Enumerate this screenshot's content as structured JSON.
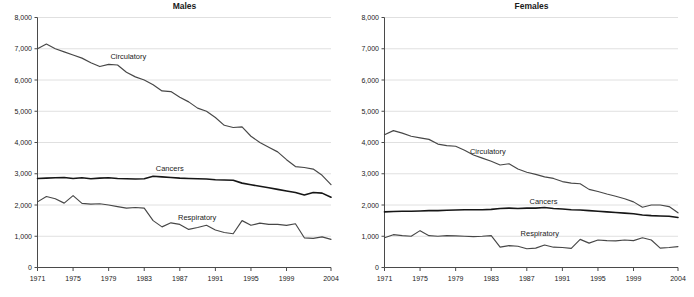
{
  "page": {
    "background": "#ffffff"
  },
  "styles": {
    "line_color": "#474747",
    "bold_line_color": "#161616",
    "grid_color": "#d8d8d8",
    "axis_color": "#4a4a4a",
    "text_color": "#1a1a1a"
  },
  "chart_data": [
    {
      "type": "line",
      "title": "Males",
      "x_start": 1971,
      "x_end": 2004,
      "x_ticks": [
        1971,
        1975,
        1979,
        1983,
        1987,
        1991,
        1995,
        1999,
        2004
      ],
      "y_ticks": [
        0,
        1000,
        2000,
        3000,
        4000,
        5000,
        6000,
        7000,
        8000
      ],
      "y_tick_labels": [
        "0",
        "1,000",
        "2,000",
        "3,000",
        "4,000",
        "5,000",
        "6,000",
        "7,000",
        "8,000"
      ],
      "ylim": [
        0,
        8000
      ],
      "grid": "horizontal",
      "legend": "inline-labels",
      "series": [
        {
          "name": "Circulatory",
          "bold": false,
          "label_anchor": {
            "year": 1979.2,
            "value": 6680
          },
          "values": [
            7000,
            7150,
            7000,
            6900,
            6800,
            6700,
            6550,
            6430,
            6500,
            6480,
            6250,
            6100,
            6000,
            5850,
            5650,
            5630,
            5450,
            5300,
            5100,
            5000,
            4800,
            4550,
            4480,
            4500,
            4200,
            4000,
            3850,
            3700,
            3450,
            3230,
            3200,
            3150,
            2950,
            2650
          ]
        },
        {
          "name": "Cancers",
          "bold": true,
          "label_anchor": {
            "year": 1984.3,
            "value": 3090
          },
          "values": [
            2850,
            2860,
            2870,
            2880,
            2850,
            2870,
            2840,
            2860,
            2870,
            2850,
            2840,
            2830,
            2840,
            2920,
            2900,
            2880,
            2860,
            2850,
            2840,
            2830,
            2810,
            2800,
            2790,
            2700,
            2650,
            2600,
            2550,
            2500,
            2450,
            2400,
            2320,
            2400,
            2380,
            2250
          ]
        },
        {
          "name": "Respiratory",
          "bold": false,
          "label_anchor": {
            "year": 1986.8,
            "value": 1520
          },
          "values": [
            2100,
            2270,
            2200,
            2060,
            2300,
            2050,
            2030,
            2040,
            2000,
            1950,
            1900,
            1920,
            1900,
            1500,
            1300,
            1430,
            1380,
            1220,
            1280,
            1350,
            1200,
            1120,
            1080,
            1500,
            1350,
            1420,
            1380,
            1380,
            1350,
            1400,
            950,
            930,
            980,
            900
          ]
        }
      ]
    },
    {
      "type": "line",
      "title": "Females",
      "x_start": 1971,
      "x_end": 2004,
      "x_ticks": [
        1971,
        1975,
        1979,
        1983,
        1987,
        1991,
        1995,
        1999,
        2004
      ],
      "y_ticks": [
        0,
        1000,
        2000,
        3000,
        4000,
        5000,
        6000,
        7000,
        8000
      ],
      "y_tick_labels": [
        "0",
        "1,000",
        "2,000",
        "3,000",
        "4,000",
        "5,000",
        "6,000",
        "7,000",
        "8,000"
      ],
      "ylim": [
        0,
        8000
      ],
      "grid": "horizontal",
      "legend": "inline-labels",
      "series": [
        {
          "name": "Circulatory",
          "bold": false,
          "label_anchor": {
            "year": 1980.6,
            "value": 3640
          },
          "values": [
            4250,
            4380,
            4300,
            4200,
            4150,
            4100,
            3950,
            3900,
            3880,
            3750,
            3600,
            3500,
            3400,
            3280,
            3320,
            3150,
            3050,
            2980,
            2900,
            2850,
            2750,
            2700,
            2680,
            2500,
            2430,
            2350,
            2280,
            2200,
            2100,
            1930,
            2000,
            2000,
            1950,
            1750
          ]
        },
        {
          "name": "Cancers",
          "bold": true,
          "label_anchor": {
            "year": 1987.3,
            "value": 2030
          },
          "values": [
            1780,
            1790,
            1800,
            1800,
            1810,
            1820,
            1820,
            1830,
            1840,
            1850,
            1850,
            1850,
            1860,
            1890,
            1900,
            1890,
            1900,
            1900,
            1920,
            1890,
            1870,
            1850,
            1840,
            1820,
            1800,
            1780,
            1760,
            1740,
            1720,
            1680,
            1660,
            1650,
            1640,
            1600
          ]
        },
        {
          "name": "Respiratory",
          "bold": false,
          "label_anchor": {
            "year": 1986.3,
            "value": 1000
          },
          "values": [
            950,
            1050,
            1020,
            1000,
            1180,
            1020,
            1000,
            1020,
            1010,
            1000,
            990,
            1000,
            1020,
            650,
            700,
            680,
            600,
            620,
            720,
            650,
            640,
            610,
            900,
            780,
            880,
            860,
            850,
            880,
            860,
            950,
            880,
            620,
            640,
            670
          ]
        }
      ]
    }
  ]
}
